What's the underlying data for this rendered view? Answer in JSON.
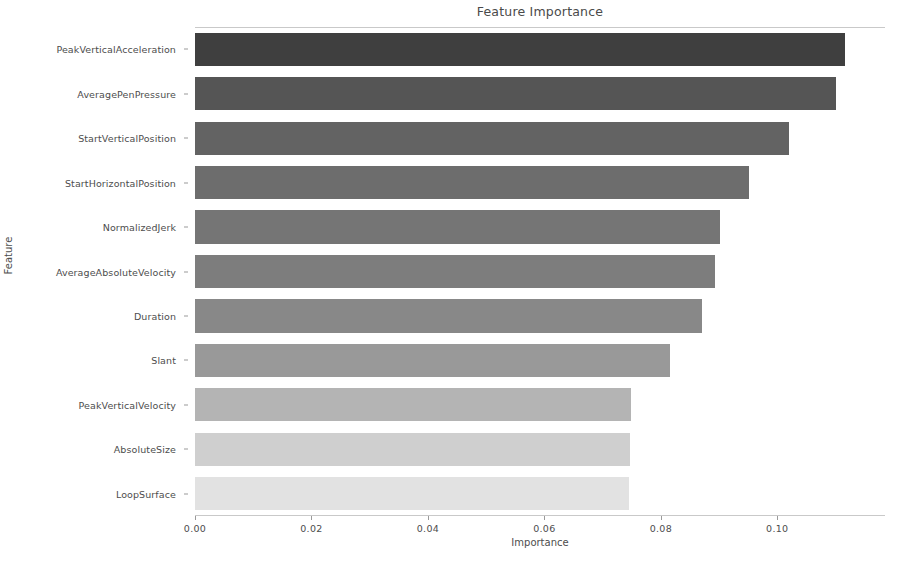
{
  "chart_data": {
    "type": "bar",
    "orientation": "horizontal",
    "title": "Feature Importance",
    "xlabel": "Importance",
    "ylabel": "Feature",
    "grid": false,
    "legend": null,
    "xlim": [
      0.0,
      0.1185
    ],
    "xticks": [
      0.0,
      0.02,
      0.04,
      0.06,
      0.08,
      0.1
    ],
    "xticklabels": [
      "0.00",
      "0.02",
      "0.04",
      "0.06",
      "0.08",
      "0.10"
    ],
    "categories": [
      "PeakVerticalAcceleration",
      "AveragePenPressure",
      "StartVerticalPosition",
      "StartHorizontalPosition",
      "NormalizedJerk",
      "AverageAbsoluteVelocity",
      "Duration",
      "Slant",
      "PeakVerticalVelocity",
      "AbsoluteSize",
      "LoopSurface"
    ],
    "values": [
      0.1117,
      0.11,
      0.102,
      0.0952,
      0.0901,
      0.0893,
      0.0871,
      0.0816,
      0.0748,
      0.0747,
      0.0746
    ],
    "bar_colors": [
      "#3f3f3f",
      "#555555",
      "#636363",
      "#6d6d6d",
      "#757575",
      "#7d7d7d",
      "#888888",
      "#999999",
      "#b4b4b4",
      "#cfcfcf",
      "#e2e2e2"
    ],
    "colormap": "Greys (dark to light, descending importance)"
  },
  "figure": {
    "background": "#ffffff",
    "axis_color": "#c9c9c9",
    "tick_color": "#9a9a9a",
    "text_color": "#4d4d4d"
  }
}
